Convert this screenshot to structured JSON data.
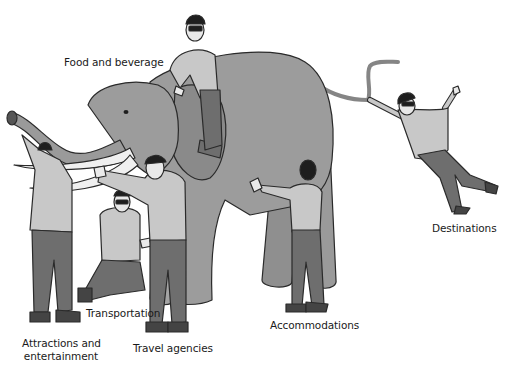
{
  "labels": {
    "food": "Food and beverage",
    "attractions_line1": "Attractions and",
    "attractions_line2": "entertainment",
    "transportation": "Transportation",
    "travel_agencies": "Travel agencies",
    "accommodations": "Accommodations",
    "destinations": "Destinations"
  },
  "colors": {
    "elephant": "#9c9c9c",
    "elephant_shadow": "#858585",
    "shirt": "#c8c8c8",
    "pants": "#6e6e6e",
    "hair": "#1e1e1e",
    "tusk": "#f0f0f0",
    "outline": "#2a2a2a"
  }
}
